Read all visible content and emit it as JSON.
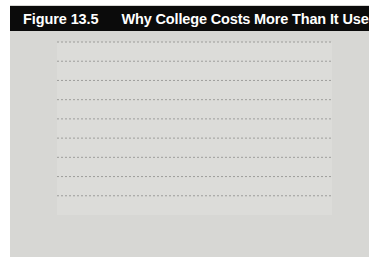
{
  "header": {
    "figure_number": "Figure 13.5",
    "title": "Why College Costs More Than It Used To",
    "bar_color": "#0b0b0b",
    "text_color": "#ffffff"
  },
  "panel": {
    "background_color": "#d7d7d4",
    "plot_background_color": "#dcdcd9"
  },
  "chart_data": {
    "type": "line",
    "title": "Why College Costs More Than It Used To",
    "xlabel": "Year",
    "ylabel": "",
    "xlim": [
      1988,
      2016
    ],
    "ylim": [
      0,
      9000
    ],
    "grid": true,
    "grid_style": "dashed-horizontal",
    "legend": "inline-labels",
    "ytick_labels": [
      "$0",
      "$1,000",
      "$2,000",
      "$3,000",
      "$4,000",
      "$5,000",
      "$6,000",
      "$7,000",
      "$8,000",
      "$9,000"
    ],
    "ytick_values": [
      0,
      1000,
      2000,
      3000,
      4000,
      5000,
      6000,
      7000,
      8000,
      9000
    ],
    "xtick_labels": [
      "1988",
      "1992",
      "1998",
      "2004",
      "2010",
      "2016"
    ],
    "xtick_values": [
      1988,
      1992,
      1998,
      2004,
      2010,
      2016
    ],
    "series": [
      {
        "name": "Government aid",
        "label": "Government aid",
        "color": "#1a1a1a",
        "end_label": "$6,954",
        "end_value": 6954,
        "x": [
          1988,
          1990,
          1992,
          1994,
          1996,
          1998,
          2000,
          2002,
          2004,
          2006,
          2008,
          2010,
          2012,
          2014,
          2016
        ],
        "values": [
          8500,
          8250,
          7950,
          7620,
          7600,
          7650,
          8150,
          8600,
          8900,
          8000,
          8250,
          7500,
          6800,
          6300,
          6954
        ]
      },
      {
        "name": "Tuition",
        "label": "Tuition",
        "color": "#8a8a88",
        "end_label": "$6,305",
        "end_value": 6305,
        "x": [
          1988,
          1990,
          1992,
          1994,
          1996,
          1998,
          2000,
          2002,
          2004,
          2006,
          2008,
          2010,
          2012,
          2014,
          2016
        ],
        "values": [
          2700,
          2720,
          2800,
          3000,
          3150,
          3300,
          3400,
          3480,
          3550,
          3700,
          3950,
          4350,
          4800,
          5500,
          6305
        ]
      }
    ]
  }
}
